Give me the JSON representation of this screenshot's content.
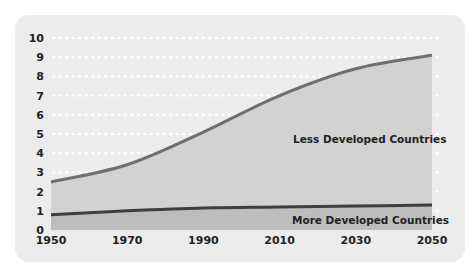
{
  "chart_data": {
    "type": "area",
    "title": "",
    "xlabel": "",
    "ylabel": "",
    "xlim": [
      1950,
      2050
    ],
    "ylim": [
      0,
      10
    ],
    "x_ticks": [
      "1950",
      "1970",
      "1990",
      "2010",
      "2030",
      "2050"
    ],
    "y_ticks": [
      "0",
      "1",
      "2",
      "3",
      "4",
      "5",
      "6",
      "7",
      "8",
      "9",
      "10"
    ],
    "grid": "horizontal dotted",
    "x": [
      1950,
      1970,
      1990,
      2010,
      2030,
      2050
    ],
    "series": [
      {
        "name": "More Developed Countries",
        "values": [
          0.8,
          1.0,
          1.15,
          1.2,
          1.25,
          1.3
        ]
      },
      {
        "name": "Less Developed Countries (total world)",
        "values": [
          2.5,
          3.4,
          5.1,
          7.0,
          8.4,
          9.1
        ]
      }
    ],
    "annotations": [
      "Less Developed Countries",
      "More Developed Countries"
    ],
    "colors": {
      "card": "#ececec",
      "ldc_fill": "#d2d2d2",
      "mdc_fill": "#bdbdbd",
      "ldc_line": "#6f6f6f",
      "mdc_line": "#3e3e3e",
      "grid": "#ffffff"
    }
  }
}
